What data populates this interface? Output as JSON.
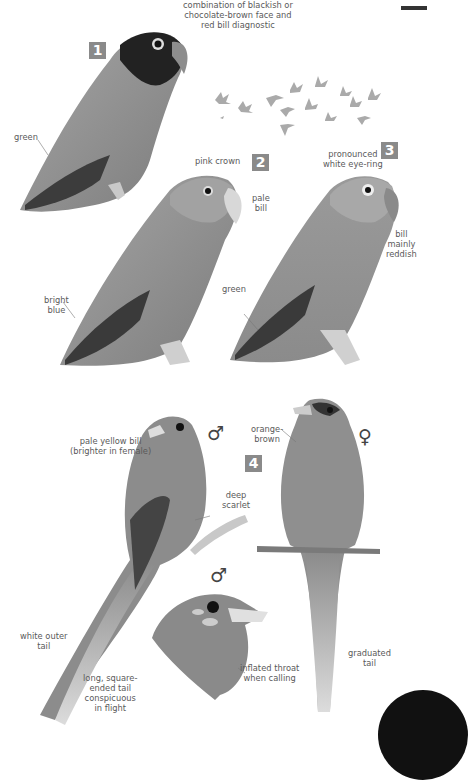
{
  "page": {
    "edge_marker": "thumb-tab",
    "corner_tab": "black-quarter-circle"
  },
  "plates": [
    {
      "number": "1",
      "labels": {
        "face": "combination of blackish or chocolate-brown face and red bill diagnostic",
        "face_lines": [
          "combination of blackish or",
          "chocolate-brown face and",
          "red bill diagnostic"
        ],
        "body": "green"
      }
    },
    {
      "number": "2",
      "labels": {
        "crown": "pink crown",
        "bill_lines": [
          "pale",
          "bill"
        ],
        "wing_lines": [
          "bright",
          "blue"
        ]
      }
    },
    {
      "number": "3",
      "labels": {
        "eye_lines": [
          "pronounced",
          "white eye-ring"
        ],
        "bill_lines": [
          "bill",
          "mainly",
          "reddish"
        ],
        "body": "green"
      }
    },
    {
      "number": "4",
      "male_symbol": "♂",
      "female_symbol": "♀",
      "labels": {
        "bill_lines": [
          "pale yellow bill",
          "(brighter in female)"
        ],
        "body_lines": [
          "deep",
          "scarlet"
        ],
        "female_lines": [
          "orange-",
          "brown"
        ],
        "outer_tail_lines": [
          "white outer",
          "tail"
        ],
        "tail_lines": [
          "long, square-",
          "ended tail",
          "conspicuous",
          "in flight"
        ],
        "throat_lines": [
          "inflated throat",
          "when calling"
        ],
        "graduated_lines": [
          "graduated",
          "tail"
        ]
      }
    }
  ],
  "flock": {
    "bird_count": 14
  }
}
